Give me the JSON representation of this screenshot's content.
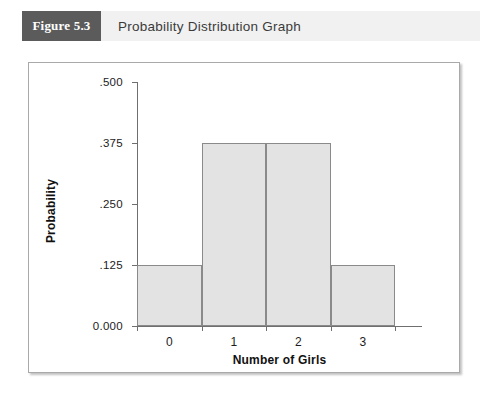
{
  "header": {
    "badge_label": "Figure 5.3",
    "title": "Probability Distribution Graph",
    "badge_color": "#5b5b5b",
    "band_color": "#f1f1f1",
    "title_color": "#3b3b3b"
  },
  "chart_data": {
    "type": "bar",
    "title": "Probability Distribution Graph",
    "categories": [
      "0",
      "1",
      "2",
      "3"
    ],
    "values": [
      0.125,
      0.375,
      0.375,
      0.125
    ],
    "xlabel": "Number of Girls",
    "ylabel": "Probability",
    "ylim": [
      0.0,
      0.5
    ],
    "ytick_labels": [
      "0.000",
      ".125",
      ".250",
      ".375",
      ".500"
    ],
    "ytick_values": [
      0.0,
      0.125,
      0.25,
      0.375,
      0.5
    ],
    "xtick_labels": [
      "0",
      "1",
      "2",
      "3"
    ],
    "grid": false,
    "legend": "none",
    "bar_fill_color": "#e3e3e3",
    "bar_edge_color": "#8a8a8a",
    "axis_color": "#6f6f6f",
    "histogram_bin_edges": [
      -0.5,
      0.5,
      1.5,
      2.5,
      3.5
    ]
  }
}
